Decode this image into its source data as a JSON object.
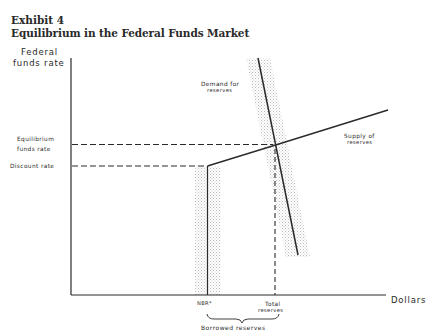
{
  "exhibit": {
    "number": "Exhibit 4",
    "title": "Equilibrium in the Federal Funds Market"
  },
  "axes": {
    "y_label_line1": "Federal",
    "y_label_line2": "funds rate",
    "x_label": "Dollars"
  },
  "rate_labels": {
    "equilibrium_line1": "Equilibrium",
    "equilibrium_line2": "funds rate",
    "discount": "Discount rate"
  },
  "curves": {
    "demand_line1": "Demand for",
    "demand_line2": "reserves",
    "supply_line1": "Supply of",
    "supply_line2": "reserves"
  },
  "x_markers": {
    "nbr": "NBR*",
    "total_line1": "Total",
    "total_line2": "reserves",
    "borrowed": "Borrowed reserves"
  },
  "colors": {
    "ink": "#2a2a2a",
    "stipple": "#b8b8b8",
    "background": "#ffffff"
  }
}
